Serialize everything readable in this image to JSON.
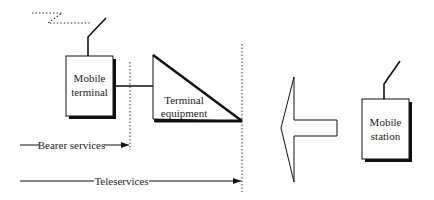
{
  "diagram": {
    "nodes": {
      "mobile_terminal": {
        "label_line1": "Mobile",
        "label_line2": "terminal"
      },
      "terminal_equipment": {
        "label_line1": "Terminal",
        "label_line2": "equipment"
      },
      "mobile_station": {
        "label_line1": "Mobile",
        "label_line2": "station"
      }
    },
    "spans": {
      "bearer": {
        "label": "Bearer services"
      },
      "tele": {
        "label": "Teleservices"
      }
    },
    "icons": {
      "radio_signal": "radio-signal-icon",
      "antenna": "antenna-icon",
      "big_arrow": "left-arrow-icon"
    },
    "colors": {
      "stroke": "#111111",
      "background": "#ffffff",
      "text": "#222222"
    }
  }
}
